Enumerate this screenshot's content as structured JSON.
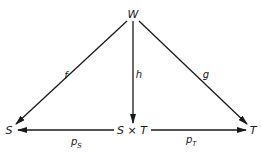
{
  "diagram": {
    "type": "commutative-diagram",
    "nodes": {
      "W": "W",
      "S": "S",
      "SxT": "S × T",
      "T": "T"
    },
    "edges": [
      {
        "id": "f",
        "from": "W",
        "to": "S",
        "label": "f"
      },
      {
        "id": "h",
        "from": "W",
        "to": "SxT",
        "label": "h"
      },
      {
        "id": "g",
        "from": "W",
        "to": "T",
        "label": "g"
      },
      {
        "id": "pS",
        "from": "SxT",
        "to": "S",
        "label": "p",
        "subscript": "S"
      },
      {
        "id": "pT",
        "from": "SxT",
        "to": "T",
        "label": "p",
        "subscript": "T"
      }
    ]
  }
}
